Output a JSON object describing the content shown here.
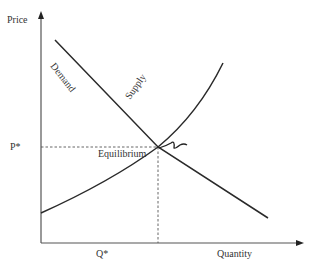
{
  "diagram": {
    "axes": {
      "y_label": "Price",
      "x_label": "Quantity",
      "y_tick": "P*",
      "x_tick": "Q*"
    },
    "curves": {
      "demand_label": "Demand",
      "supply_label": "Supply"
    },
    "equilibrium_label": "Equilibrium",
    "colors": {
      "axis": "#555555",
      "curve": "#2a2a2a",
      "dashed": "#555555",
      "text": "#333333",
      "background": "#ffffff"
    }
  }
}
